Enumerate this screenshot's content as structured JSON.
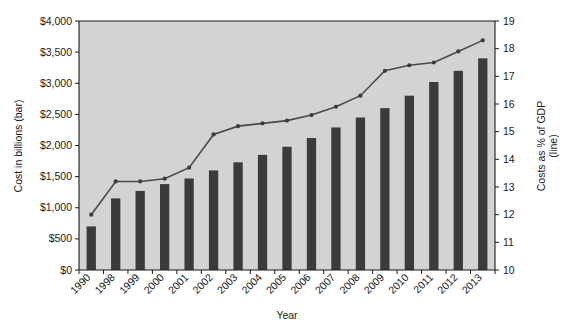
{
  "chart_data": {
    "type": "bar",
    "title": "",
    "xlabel": "Year",
    "ylabel": "Cost in billions (bar)",
    "y2label": "Costs as % of GDP (line)",
    "categories": [
      "1990",
      "1998",
      "1999",
      "2000",
      "2001",
      "2002",
      "2003",
      "2004",
      "2005",
      "2006",
      "2007",
      "2008",
      "2009",
      "2010",
      "2011",
      "2012",
      "2013"
    ],
    "ylim": [
      0,
      4000
    ],
    "ytick_labels": [
      "$0",
      "$500",
      "$1,000",
      "$1,500",
      "$2,000",
      "$2,500",
      "$3,000",
      "$3,500",
      "$4,000"
    ],
    "ytick_values": [
      0,
      500,
      1000,
      1500,
      2000,
      2500,
      3000,
      3500,
      4000
    ],
    "y2lim": [
      10,
      19
    ],
    "y2tick_labels": [
      "10",
      "11",
      "12",
      "13",
      "14",
      "15",
      "16",
      "17",
      "18",
      "19"
    ],
    "y2tick_values": [
      10,
      11,
      12,
      13,
      14,
      15,
      16,
      17,
      18,
      19
    ],
    "grid": false,
    "legend_position": "none",
    "series": [
      {
        "name": "Cost in billions (bar)",
        "type": "bar",
        "axis": "left",
        "color": "#3b3b3b",
        "values": [
          700,
          1150,
          1270,
          1380,
          1470,
          1600,
          1730,
          1850,
          1980,
          2120,
          2290,
          2450,
          2600,
          2800,
          3020,
          3200,
          3400
        ]
      },
      {
        "name": "Costs as % of GDP (line)",
        "type": "line",
        "axis": "right",
        "color": "#4a4a4a",
        "values": [
          12.0,
          13.2,
          13.2,
          13.3,
          13.7,
          14.9,
          15.2,
          15.3,
          15.4,
          15.6,
          15.9,
          16.3,
          17.2,
          17.4,
          17.5,
          17.9,
          18.3
        ]
      }
    ]
  },
  "axis_titles": {
    "x": "Year",
    "y_left": "Cost in billions (bar)",
    "y_right_line1": "Costs as % of GDP",
    "y_right_line2": "(line)"
  }
}
